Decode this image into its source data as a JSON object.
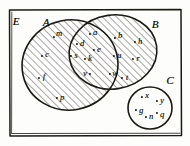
{
  "diagram": {
    "style": "hand-drawn",
    "ink_color": "#17160f",
    "paper_color": "#fdfdfb",
    "hatch_color": "#5d5a4e"
  },
  "universal_set": {
    "name": "universal-set",
    "label": "E",
    "label_x": 16,
    "label_y": 21,
    "frame": {
      "x": 8,
      "y": 9,
      "width": 174,
      "height": 128
    }
  },
  "sets": [
    {
      "id": "A",
      "name": "set-a",
      "label": "A",
      "shape": "ellipse",
      "hatched": true,
      "label_x": 46,
      "label_y": 22,
      "cx": 70,
      "cy": 65,
      "rx": 48,
      "ry": 45,
      "rotate": -12
    },
    {
      "id": "B",
      "name": "set-b",
      "label": "B",
      "shape": "ellipse",
      "hatched": true,
      "label_x": 155,
      "label_y": 24,
      "cx": 113,
      "cy": 52,
      "rx": 44,
      "ry": 37,
      "rotate": -8
    },
    {
      "id": "C",
      "name": "set-c",
      "label": "C",
      "shape": "circle",
      "hatched": false,
      "label_x": 170,
      "label_y": 80,
      "cx": 150,
      "cy": 108,
      "rx": 22,
      "ry": 21,
      "rotate": 0
    }
  ],
  "regions": [
    {
      "id": "A-only",
      "name": "region-a-only",
      "description": "elements in A but not in B",
      "members": [
        "m",
        "c",
        "f",
        "p"
      ]
    },
    {
      "id": "A-and-B",
      "name": "region-a-intersect-b",
      "description": "elements in both A and B",
      "members": [
        "a",
        "d",
        "e",
        "s",
        "k",
        "v"
      ]
    },
    {
      "id": "B-only",
      "name": "region-b-only",
      "description": "elements in B but not in A",
      "members": [
        "b",
        "h",
        "u",
        "r",
        "w",
        "t"
      ]
    },
    {
      "id": "C-only",
      "name": "region-c-only",
      "description": "elements in C",
      "members": [
        "x",
        "y",
        "g",
        "n",
        "q"
      ]
    }
  ],
  "elements": [
    {
      "label": "m",
      "region": "A-only",
      "dot_x": 54,
      "dot_y": 37,
      "label_x": 59,
      "label_y": 33
    },
    {
      "label": "c",
      "region": "A-only",
      "dot_x": 42,
      "dot_y": 56,
      "label_x": 47,
      "label_y": 54
    },
    {
      "label": "f",
      "region": "A-only",
      "dot_x": 39,
      "dot_y": 78,
      "label_x": 44,
      "label_y": 76
    },
    {
      "label": "p",
      "region": "A-only",
      "dot_x": 57,
      "dot_y": 98,
      "label_x": 62,
      "label_y": 97
    },
    {
      "label": "a",
      "region": "A-and-B",
      "dot_x": 90,
      "dot_y": 34,
      "label_x": 95,
      "label_y": 32
    },
    {
      "label": "d",
      "region": "A-and-B",
      "dot_x": 77,
      "dot_y": 44,
      "label_x": 82,
      "label_y": 43
    },
    {
      "label": "e",
      "region": "A-and-B",
      "dot_x": 94,
      "dot_y": 50,
      "label_x": 99,
      "label_y": 49
    },
    {
      "label": "s",
      "region": "A-and-B",
      "dot_x": 71,
      "dot_y": 56,
      "label_x": 76,
      "label_y": 55
    },
    {
      "label": "k",
      "region": "A-and-B",
      "dot_x": 85,
      "dot_y": 59,
      "label_x": 90,
      "label_y": 58
    },
    {
      "label": "v",
      "region": "A-and-B",
      "dot_x": 90,
      "dot_y": 74,
      "label_x": 85,
      "label_y": 73
    },
    {
      "label": "b",
      "region": "B-only",
      "dot_x": 115,
      "dot_y": 38,
      "label_x": 120,
      "label_y": 35
    },
    {
      "label": "h",
      "region": "B-only",
      "dot_x": 135,
      "dot_y": 42,
      "label_x": 140,
      "label_y": 41
    },
    {
      "label": "u",
      "region": "B-only",
      "dot_x": 114,
      "dot_y": 56,
      "label_x": 119,
      "label_y": 55
    },
    {
      "label": "r",
      "region": "B-only",
      "dot_x": 133,
      "dot_y": 59,
      "label_x": 138,
      "label_y": 58
    },
    {
      "label": "w",
      "region": "B-only",
      "dot_x": 110,
      "dot_y": 74,
      "label_x": 115,
      "label_y": 73
    },
    {
      "label": "t",
      "region": "B-only",
      "dot_x": 122,
      "dot_y": 78,
      "label_x": 127,
      "label_y": 77
    },
    {
      "label": "x",
      "region": "C-only",
      "dot_x": 142,
      "dot_y": 97,
      "label_x": 147,
      "label_y": 95
    },
    {
      "label": "y",
      "region": "C-only",
      "dot_x": 157,
      "dot_y": 101,
      "label_x": 162,
      "label_y": 100
    },
    {
      "label": "g",
      "region": "C-only",
      "dot_x": 136,
      "dot_y": 110,
      "label_x": 141,
      "label_y": 110
    },
    {
      "label": "n",
      "region": "C-only",
      "dot_x": 146,
      "dot_y": 117,
      "label_x": 151,
      "label_y": 116
    },
    {
      "label": "q",
      "region": "C-only",
      "dot_x": 157,
      "dot_y": 113,
      "label_x": 162,
      "label_y": 114
    }
  ]
}
